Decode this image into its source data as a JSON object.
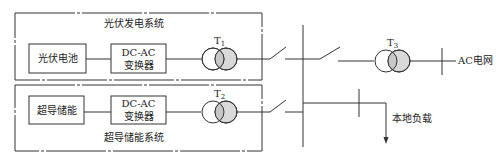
{
  "diagram": {
    "type": "power-system-single-line-diagram",
    "colors": {
      "line": "#333333",
      "transformer_fill": "#d9d9d9",
      "background": "#ffffff"
    },
    "pv_system": {
      "title": "光伏发电系统",
      "blocks": [
        {
          "id": "pv_cell",
          "label": "光伏电池"
        },
        {
          "id": "pv_inverter",
          "label_line1": "DC-AC",
          "label_line2": "变换器"
        }
      ],
      "transformer": {
        "label": "T",
        "subscript": "1"
      }
    },
    "smes_system": {
      "title": "超导储能系统",
      "blocks": [
        {
          "id": "smes",
          "label": "超导储能"
        },
        {
          "id": "smes_inverter",
          "label_line1": "DC-AC",
          "label_line2": "变换器"
        }
      ],
      "transformer": {
        "label": "T",
        "subscript": "2"
      }
    },
    "grid_transformer": {
      "label": "T",
      "subscript": "3"
    },
    "ac_grid_label": "AC电网",
    "local_load_label": "本地负载"
  }
}
